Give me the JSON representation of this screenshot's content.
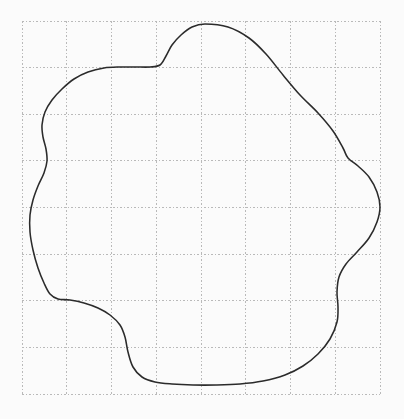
{
  "page": {
    "background_color": "#fbfbfb",
    "width": 404,
    "height": 419
  },
  "grid": {
    "name": "dotted-square-grid",
    "line_color": "#b9b9b9",
    "style": "dotted",
    "columns": 8,
    "rows": 8,
    "x_left": 22,
    "x_right": 380,
    "y_top": 21,
    "y_bottom": 394,
    "cell_width": 44.75,
    "cell_height": 46.625,
    "x_positions": [
      22,
      66.75,
      111.5,
      156.25,
      201,
      245.75,
      290.5,
      335.25,
      380
    ],
    "y_positions": [
      21,
      67.6,
      114.3,
      160.9,
      207.5,
      254.1,
      300.8,
      347.4,
      394
    ]
  },
  "chart_data": {
    "type": "line",
    "title": "",
    "xlabel": "",
    "ylabel": "",
    "grid": true,
    "legend": false,
    "xlim": [
      22,
      380
    ],
    "ylim": [
      21,
      394
    ],
    "series": [
      {
        "name": "closed-blob-contour",
        "closed": true,
        "stroke_color": "#2b2b2b",
        "stroke_width": 1.55,
        "fill": "none",
        "points": [
          [
            205,
            24
          ],
          [
            228,
            27
          ],
          [
            249,
            38
          ],
          [
            266,
            54
          ],
          [
            283,
            75
          ],
          [
            300,
            95
          ],
          [
            318,
            113
          ],
          [
            333,
            131
          ],
          [
            343,
            148
          ],
          [
            348,
            158
          ],
          [
            358,
            166
          ],
          [
            369,
            177
          ],
          [
            377,
            192
          ],
          [
            380,
            207
          ],
          [
            377,
            222
          ],
          [
            369,
            238
          ],
          [
            357,
            252
          ],
          [
            346,
            264
          ],
          [
            339,
            277
          ],
          [
            337,
            292
          ],
          [
            338,
            307
          ],
          [
            337,
            322
          ],
          [
            330,
            339
          ],
          [
            318,
            354
          ],
          [
            303,
            366
          ],
          [
            285,
            375
          ],
          [
            263,
            381
          ],
          [
            240,
            384
          ],
          [
            216,
            385
          ],
          [
            193,
            385
          ],
          [
            172,
            384
          ],
          [
            155,
            382
          ],
          [
            142,
            377
          ],
          [
            133,
            367
          ],
          [
            128,
            352
          ],
          [
            125,
            337
          ],
          [
            120,
            325
          ],
          [
            110,
            315
          ],
          [
            98,
            308
          ],
          [
            84,
            303
          ],
          [
            70,
            300
          ],
          [
            58,
            299
          ],
          [
            50,
            294
          ],
          [
            44,
            283
          ],
          [
            38,
            268
          ],
          [
            33,
            250
          ],
          [
            30,
            232
          ],
          [
            30,
            215
          ],
          [
            33,
            200
          ],
          [
            38,
            186
          ],
          [
            44,
            173
          ],
          [
            47,
            161
          ],
          [
            46,
            149
          ],
          [
            43,
            137
          ],
          [
            42,
            125
          ],
          [
            45,
            112
          ],
          [
            52,
            100
          ],
          [
            62,
            89
          ],
          [
            74,
            79
          ],
          [
            88,
            72
          ],
          [
            104,
            68
          ],
          [
            120,
            67
          ],
          [
            136,
            67
          ],
          [
            150,
            67
          ],
          [
            160,
            65
          ],
          [
            166,
            56
          ],
          [
            172,
            45
          ],
          [
            181,
            35
          ],
          [
            192,
            27
          ]
        ]
      }
    ]
  },
  "labels": {
    "caption": ""
  }
}
